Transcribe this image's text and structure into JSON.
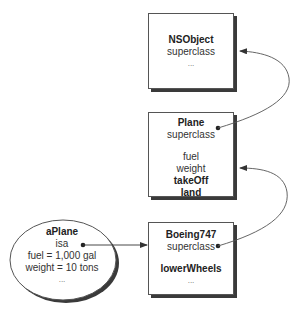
{
  "diagram": {
    "classes": [
      {
        "id": "nsobject",
        "name": "NSObject",
        "fields": [
          "superclass"
        ],
        "extra": [],
        "ellipsis": "..."
      },
      {
        "id": "plane",
        "name": "Plane",
        "fields": [
          "superclass"
        ],
        "ivars": [
          "fuel",
          "weight"
        ],
        "methods": [
          "takeOff",
          "land"
        ]
      },
      {
        "id": "boeing747",
        "name": "Boeing747",
        "fields": [
          "superclass"
        ],
        "methods": [
          "lowerWheels"
        ],
        "ellipsis": "..."
      }
    ],
    "instance": {
      "name": "aPlane",
      "lines": [
        "isa",
        "fuel = 1,000 gal",
        "weight = 10 tons"
      ],
      "ellipsis": "..."
    },
    "arrows": [
      {
        "from": "aPlane.isa",
        "to": "Boeing747"
      },
      {
        "from": "Boeing747.superclass",
        "to": "Plane"
      },
      {
        "from": "Plane.superclass",
        "to": "NSObject"
      }
    ],
    "colors": {
      "stroke": "#555555",
      "shadow": "#3a3a3a",
      "text": "#333333"
    }
  }
}
